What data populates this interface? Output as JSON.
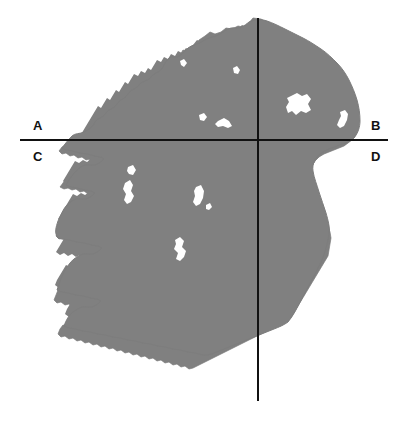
{
  "figure": {
    "kind": "map-diagram",
    "width": 408,
    "height": 424,
    "background_color": "#ffffff"
  },
  "map": {
    "landmass_name": "ireland-landmass",
    "land_color": "#808080",
    "land_stroke_color": "#707070",
    "water_color": "#ffffff",
    "lakes": [
      {
        "name": "lough-neagh",
        "label": ""
      },
      {
        "name": "lough-corrib",
        "label": ""
      },
      {
        "name": "lough-ree",
        "label": ""
      },
      {
        "name": "lough-derg",
        "label": ""
      },
      {
        "name": "lough-mask",
        "label": ""
      },
      {
        "name": "lough-erne",
        "label": ""
      },
      {
        "name": "strangford-lough",
        "label": ""
      }
    ]
  },
  "axes": {
    "color": "#111111",
    "thickness_px": 2,
    "horizontal": {
      "name": "horizontal-axis",
      "x_start": 20,
      "x_end": 388,
      "y": 140
    },
    "vertical": {
      "name": "vertical-axis",
      "y_start": 18,
      "y_end": 401,
      "x": 258
    },
    "origin": {
      "x": 258,
      "y": 140
    }
  },
  "labels": {
    "a": "A",
    "b": "B",
    "c": "C",
    "d": "D"
  }
}
